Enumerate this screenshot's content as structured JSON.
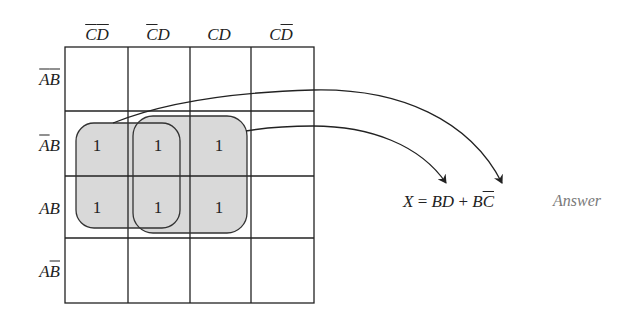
{
  "kmap": {
    "columns": [
      {
        "var1": "C",
        "var1_bar": true,
        "var2": "D",
        "var2_bar": true
      },
      {
        "var1": "C",
        "var1_bar": true,
        "var2": "D",
        "var2_bar": false
      },
      {
        "var1": "C",
        "var1_bar": false,
        "var2": "D",
        "var2_bar": false
      },
      {
        "var1": "C",
        "var1_bar": false,
        "var2": "D",
        "var2_bar": true
      }
    ],
    "rows": [
      {
        "var1": "A",
        "var1_bar": true,
        "var2": "B",
        "var2_bar": true
      },
      {
        "var1": "A",
        "var1_bar": true,
        "var2": "B",
        "var2_bar": false
      },
      {
        "var1": "A",
        "var1_bar": false,
        "var2": "B",
        "var2_bar": false
      },
      {
        "var1": "A",
        "var1_bar": false,
        "var2": "B",
        "var2_bar": true
      }
    ],
    "cells": [
      [
        "",
        "",
        "",
        ""
      ],
      [
        "1",
        "1",
        "1",
        ""
      ],
      [
        "1",
        "1",
        "1",
        ""
      ],
      [
        "",
        "",
        "",
        ""
      ]
    ],
    "groups": [
      {
        "term": "BC̄",
        "cells": "rows 2-3, columns 1-2"
      },
      {
        "term": "BD",
        "cells": "rows 2-3, columns 2-3"
      }
    ],
    "fill_color": "#d9d9d9",
    "line_color": "#222222"
  },
  "equation": {
    "lhs": "X",
    "eq": "=",
    "term1": "BD",
    "plus": "+",
    "term2_b": "B",
    "term2_c": "C"
  },
  "answer_label": "Answer",
  "answer_color": "#7a7a7a"
}
